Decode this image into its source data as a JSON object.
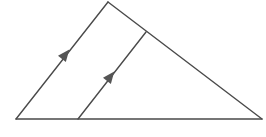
{
  "diagram": {
    "type": "geometry-triangle-with-parallel-line",
    "partial_label": ")",
    "colors": {
      "stroke": "#4a4a4a",
      "arrow": "#555555",
      "background": "#ffffff"
    },
    "points": {
      "apex": [
        108,
        2
      ],
      "bottom_left": [
        16,
        119
      ],
      "bottom_right": [
        262,
        119
      ],
      "inner_base": [
        78,
        119
      ],
      "inner_top": [
        146,
        32
      ]
    },
    "segments": [
      {
        "id": "left-side",
        "from": "bottom_left",
        "to": "apex"
      },
      {
        "id": "right-side",
        "from": "apex",
        "to": "bottom_right"
      },
      {
        "id": "base",
        "from": "bottom_left",
        "to": "bottom_right"
      },
      {
        "id": "inner-parallel",
        "from": "inner_base",
        "to": "inner_top"
      }
    ],
    "parallel_marks": [
      {
        "on": "left-side",
        "at": [
          65,
          55
        ],
        "count": 1
      },
      {
        "on": "inner-parallel",
        "at": [
          110,
          77
        ],
        "count": 1
      }
    ]
  }
}
